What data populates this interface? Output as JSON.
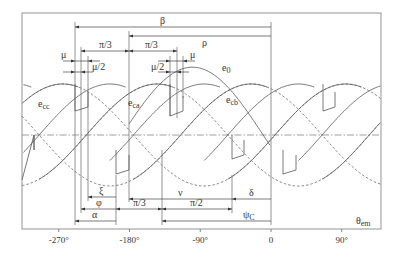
{
  "figure": {
    "axis_label": "θ",
    "axis_label_sub": "em",
    "ticks": [
      {
        "deg": -270,
        "label": "-270°"
      },
      {
        "deg": -180,
        "label": "-180°"
      },
      {
        "deg": -90,
        "label": "-90°"
      },
      {
        "deg": 0,
        "label": "0"
      },
      {
        "deg": 90,
        "label": "90°"
      }
    ],
    "curve_labels": [
      {
        "name": "e",
        "sub": "cc",
        "x": 38,
        "y": 107
      },
      {
        "name": "e",
        "sub": "ca",
        "x": 128,
        "y": 106
      },
      {
        "name": "e",
        "sub": "0",
        "x": 222,
        "y": 71
      },
      {
        "name": "e",
        "sub": "cb",
        "x": 226,
        "y": 103
      }
    ],
    "top_dimensions": [
      {
        "label": "β",
        "x1": 75,
        "x2": 271,
        "y": 27,
        "lx": 160,
        "ly": 24,
        "dir": "left"
      },
      {
        "label": "ρ",
        "x1": 129,
        "x2": 271,
        "y": 36,
        "lx": 202,
        "ly": 46,
        "dir": "left"
      },
      {
        "label": "π/3",
        "x1": 81,
        "x2": 129,
        "y": 51,
        "lx": 99,
        "ly": 48,
        "dir": "both"
      },
      {
        "label": "π/3",
        "x1": 129,
        "x2": 177,
        "y": 51,
        "lx": 145,
        "ly": 48,
        "dir": "both"
      },
      {
        "label": "μ",
        "x1": 75,
        "x2": 88,
        "y": 61,
        "lx": 61,
        "ly": 58,
        "dir": "out"
      },
      {
        "label": "μ",
        "x1": 170,
        "x2": 183,
        "y": 61,
        "lx": 190,
        "ly": 58,
        "dir": "out"
      },
      {
        "label": "μ/2",
        "x1": 75,
        "x2": 81,
        "y": 72,
        "lx": 92,
        "ly": 70,
        "dir": "out"
      },
      {
        "label": "μ/2",
        "x1": 170,
        "x2": 177,
        "y": 72,
        "lx": 151,
        "ly": 70,
        "dir": "out"
      }
    ],
    "bottom_dimensions": [
      {
        "label": "ξ",
        "x1": 88,
        "x2": 116,
        "y": 197,
        "lx": 99,
        "ly": 194,
        "dir": "left"
      },
      {
        "label": "ν",
        "x1": 129,
        "x2": 232,
        "y": 199,
        "lx": 178,
        "ly": 196,
        "dir": "left"
      },
      {
        "label": "δ",
        "x1": 232,
        "x2": 271,
        "y": 199,
        "lx": 249,
        "ly": 196,
        "dir": "left"
      },
      {
        "label": "φ",
        "x1": 81,
        "x2": 116,
        "y": 209,
        "lx": 96,
        "ly": 206,
        "dir": "left"
      },
      {
        "label": "π/3",
        "x1": 116,
        "x2": 162,
        "y": 209,
        "lx": 133,
        "ly": 206,
        "dir": "both"
      },
      {
        "label": "π/2",
        "x1": 162,
        "x2": 232,
        "y": 209,
        "lx": 190,
        "ly": 206,
        "dir": "both"
      },
      {
        "label": "α",
        "x1": 75,
        "x2": 116,
        "y": 221,
        "lx": 92,
        "ly": 218,
        "dir": "left"
      },
      {
        "label": "ψ",
        "x1": 162,
        "x2": 271,
        "y": 221,
        "lx": 243,
        "ly": 218,
        "sub": "C",
        "dir": "left"
      }
    ],
    "vertical_lines": [
      {
        "x": 75,
        "y1": 22,
        "y2": 225
      },
      {
        "x": 81,
        "y1": 47,
        "y2": 213
      },
      {
        "x": 88,
        "y1": 56,
        "y2": 201
      },
      {
        "x": 116,
        "y1": 175,
        "y2": 225
      },
      {
        "x": 129,
        "y1": 31,
        "y2": 202
      },
      {
        "x": 162,
        "y1": 150,
        "y2": 225
      },
      {
        "x": 170,
        "y1": 56,
        "y2": 116
      },
      {
        "x": 177,
        "y1": 47,
        "y2": 118
      },
      {
        "x": 183,
        "y1": 56,
        "y2": 98
      },
      {
        "x": 232,
        "y1": 175,
        "y2": 213
      },
      {
        "x": 271,
        "y1": 22,
        "y2": 225
      }
    ]
  },
  "chart_data": {
    "type": "line",
    "title": "",
    "xlabel": "θem",
    "ylabel": "",
    "x_ticks": [
      "-270°",
      "-180°",
      "-90°",
      "0",
      "90°"
    ],
    "xlim": [
      -305,
      142
    ],
    "series": [
      {
        "name": "e_cc",
        "kind": "sinusoid",
        "peak_deg": -265,
        "amplitude": 1.0
      },
      {
        "name": "e_ca",
        "kind": "sinusoid",
        "peak_deg": -145,
        "amplitude": 1.0
      },
      {
        "name": "e_cb",
        "kind": "sinusoid",
        "peak_deg": -25,
        "amplitude": 1.0
      },
      {
        "name": "e_0",
        "kind": "sinusoid",
        "peak_deg": -100,
        "amplitude": 1.33
      }
    ],
    "annotations": [
      "β",
      "ρ",
      "π/3",
      "π/3",
      "μ",
      "μ",
      "μ/2",
      "μ/2",
      "ξ",
      "φ",
      "α",
      "π/3",
      "ν",
      "π/2",
      "δ",
      "ψC"
    ],
    "grid": false,
    "legend": "inline labels"
  }
}
